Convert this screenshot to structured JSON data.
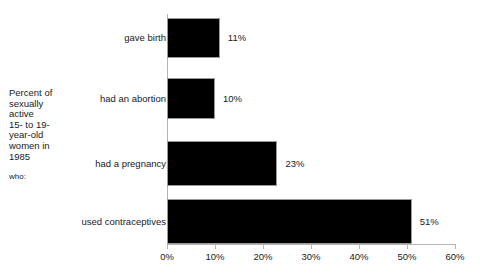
{
  "chart_data": {
    "type": "bar",
    "orientation": "horizontal",
    "title": "",
    "subtitle": "",
    "side_caption": "Percent of\nsexually\nactive\n15- to 19-\nyear-old\nwomen in\n1985",
    "side_caption_tail": "who:",
    "categories": [
      "gave birth",
      "had an abortion",
      "had a pregnancy",
      "used contraceptives"
    ],
    "values": [
      11,
      10,
      23,
      51
    ],
    "value_labels": [
      "11%",
      "10%",
      "23%",
      "51%"
    ],
    "xlabel": "",
    "ylabel": "",
    "xlim": [
      0,
      60
    ],
    "xticks": [
      0,
      10,
      20,
      30,
      40,
      50,
      60
    ],
    "xtick_labels": [
      "0%",
      "10%",
      "20%",
      "30%",
      "40%",
      "50%",
      "60%"
    ],
    "grid": false,
    "legend": false,
    "bar_color": "#000000",
    "axis_color": "#b4b4b4",
    "text_color": "#1a1a1a",
    "background": "#ffffff"
  }
}
